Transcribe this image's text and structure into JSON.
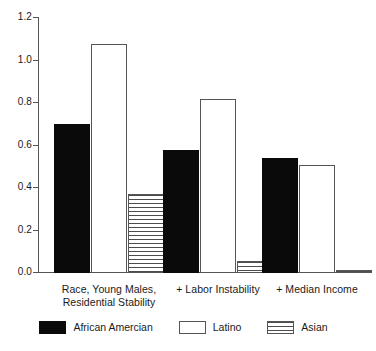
{
  "chart_data": {
    "type": "bar",
    "title": "",
    "subtitle": "",
    "xlabel": "",
    "ylabel": "",
    "ylim": [
      0.0,
      1.2
    ],
    "yticks": [
      "0.0",
      "0.2",
      "0.4",
      "0.6",
      "0.8",
      "1.0",
      "1.2"
    ],
    "ytick_values": [
      0.0,
      0.2,
      0.4,
      0.6,
      0.8,
      1.0,
      1.2
    ],
    "grid": false,
    "legend_position": "bottom",
    "categories": [
      "Race, Young Males, Residential Stability",
      "+ Labor Instability",
      "+ Median Income"
    ],
    "category_lines": [
      [
        "Race, Young Males,",
        "Residential Stability"
      ],
      [
        "+ Labor Instability"
      ],
      [
        "+ Median Income"
      ]
    ],
    "series": [
      {
        "name": "African Amercian",
        "fill": "solid",
        "values": [
          0.7,
          0.58,
          0.54
        ]
      },
      {
        "name": "Latino",
        "fill": "open",
        "values": [
          1.08,
          0.82,
          0.51
        ]
      },
      {
        "name": "Asian",
        "fill": "hatch",
        "values": [
          0.37,
          0.055,
          0.012
        ]
      }
    ]
  },
  "legend": {
    "items": [
      {
        "label": "African Amercian",
        "fill": "solid"
      },
      {
        "label": "Latino",
        "fill": "open"
      },
      {
        "label": "Asian",
        "fill": "hatch"
      }
    ]
  },
  "colors": {
    "solid": "#0a0a0a",
    "open": "#ffffff",
    "outline": "#555555",
    "hatch_line": "#4d4d4d",
    "axis": "#555555",
    "text": "#1a1a1a",
    "background": "#ffffff"
  }
}
